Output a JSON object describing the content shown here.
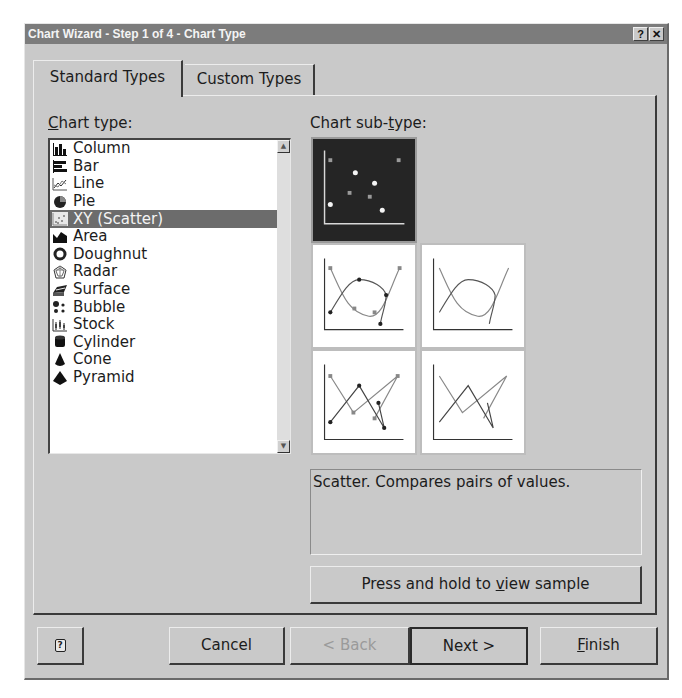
{
  "window": {
    "title": "Chart Wizard - Step 1 of 4 - Chart Type",
    "help_button": "?",
    "close_button": "✕"
  },
  "tabs": [
    {
      "label": "Standard Types",
      "active": true
    },
    {
      "label": "Custom Types",
      "active": false
    }
  ],
  "chart_type": {
    "label_prefix": "C",
    "label_rest": "hart type:",
    "items": [
      {
        "label": "Column",
        "icon": "column-chart-icon"
      },
      {
        "label": "Bar",
        "icon": "bar-chart-icon"
      },
      {
        "label": "Line",
        "icon": "line-chart-icon"
      },
      {
        "label": "Pie",
        "icon": "pie-chart-icon"
      },
      {
        "label": "XY (Scatter)",
        "icon": "scatter-chart-icon",
        "selected": true
      },
      {
        "label": "Area",
        "icon": "area-chart-icon"
      },
      {
        "label": "Doughnut",
        "icon": "doughnut-chart-icon"
      },
      {
        "label": "Radar",
        "icon": "radar-chart-icon"
      },
      {
        "label": "Surface",
        "icon": "surface-chart-icon"
      },
      {
        "label": "Bubble",
        "icon": "bubble-chart-icon"
      },
      {
        "label": "Stock",
        "icon": "stock-chart-icon"
      },
      {
        "label": "Cylinder",
        "icon": "cylinder-chart-icon"
      },
      {
        "label": "Cone",
        "icon": "cone-chart-icon"
      },
      {
        "label": "Pyramid",
        "icon": "pyramid-chart-icon"
      }
    ]
  },
  "chart_subtype": {
    "label_pre": "Chart sub-",
    "label_u": "t",
    "label_post": "ype:",
    "items": [
      {
        "name": "scatter-markers-only",
        "selected": true
      },
      {
        "name": "scatter-smoothed-lines-markers",
        "selected": false
      },
      {
        "name": "scatter-smoothed-lines",
        "selected": false
      },
      {
        "name": "scatter-lines-markers",
        "selected": false
      },
      {
        "name": "scatter-lines",
        "selected": false
      }
    ],
    "description": "Scatter. Compares pairs of values."
  },
  "sample_button": {
    "pre": "Press and hold to ",
    "u": "v",
    "post": "iew sample"
  },
  "footer": {
    "help_icon": "?",
    "cancel": "Cancel",
    "back": "< Back",
    "next": "Next >",
    "finish_u": "F",
    "finish_rest": "inish"
  },
  "colors": {
    "dialog_bg": "#c9c9c9",
    "titlebar_bg": "#7c7c7c",
    "selection_bg": "#6c6c6c",
    "list_bg": "#ffffff"
  }
}
